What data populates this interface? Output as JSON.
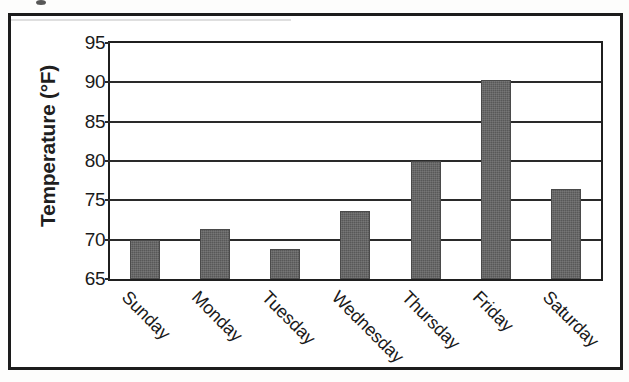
{
  "figure": {
    "background_color": "#ffffff",
    "frame_color": "#1c1c1c",
    "bar_color": "#585858",
    "axis_color": "#1f1f1f"
  },
  "axes": {
    "y_title": "Temperature (°F)",
    "y_ticks": [
      "65",
      "70",
      "75",
      "80",
      "85",
      "90",
      "95"
    ],
    "x_labels": [
      "Sunday",
      "Monday",
      "Tuesday",
      "Wednesday",
      "Thursday",
      "Friday",
      "Saturday"
    ]
  },
  "chart_data": {
    "type": "bar",
    "title": "",
    "xlabel": "",
    "ylabel": "Temperature (°F)",
    "categories": [
      "Sunday",
      "Monday",
      "Tuesday",
      "Wednesday",
      "Thursday",
      "Friday",
      "Saturday"
    ],
    "values": [
      70.0,
      71.3,
      68.8,
      73.6,
      80.0,
      90.3,
      76.4
    ],
    "ylim": [
      65,
      95
    ],
    "ytick_values": [
      65,
      70,
      75,
      80,
      85,
      90,
      95
    ],
    "ytick_step": 5,
    "grid": "horizontal",
    "legend": "none",
    "series": [
      {
        "name": "Temperature",
        "values": [
          70.0,
          71.3,
          68.8,
          73.6,
          80.0,
          90.3,
          76.4
        ]
      }
    ]
  }
}
